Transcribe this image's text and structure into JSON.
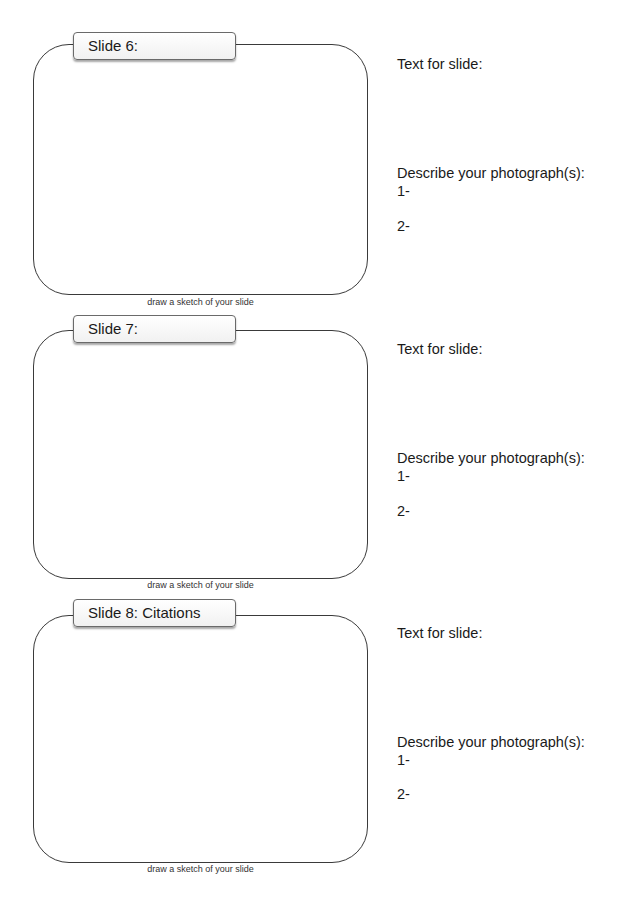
{
  "worksheet": {
    "slides": [
      {
        "label": "Slide 6:",
        "caption": "draw a sketch of your slide",
        "text_prompt": "Text for slide:",
        "describe_prompt": "Describe your photograph(s):",
        "item1": "1-",
        "item2": "2-"
      },
      {
        "label": "Slide 7:",
        "caption": "draw a sketch of your slide",
        "text_prompt": "Text for slide:",
        "describe_prompt": "Describe your photograph(s):",
        "item1": "1-",
        "item2": "2-"
      },
      {
        "label": "Slide 8: Citations",
        "caption": "draw a sketch of your slide",
        "text_prompt": "Text for slide:",
        "describe_prompt": "Describe your photograph(s):",
        "item1": "1-",
        "item2": "2-"
      }
    ]
  }
}
